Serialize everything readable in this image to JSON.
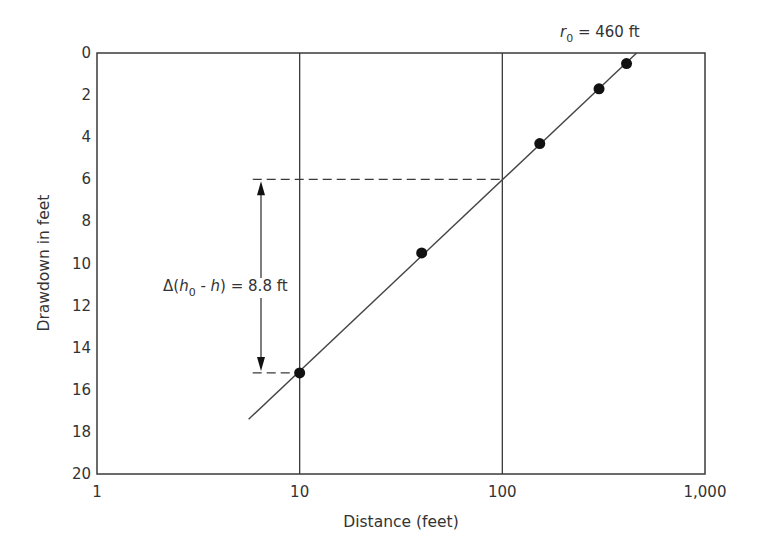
{
  "chart_data": {
    "type": "scatter",
    "title": "",
    "xlabel": "Distance (feet)",
    "ylabel": "Drawdown in feet",
    "xscale": "log",
    "xlim": [
      1,
      1000
    ],
    "ylim": [
      20,
      0
    ],
    "y_inverted": true,
    "grid": {
      "x_major": true,
      "y": false
    },
    "x_ticks": [
      1,
      10,
      100,
      1000
    ],
    "x_tick_labels": [
      "1",
      "10",
      "100",
      "1,000"
    ],
    "y_ticks": [
      0,
      2,
      4,
      6,
      8,
      10,
      12,
      14,
      16,
      18,
      20
    ],
    "y_tick_labels": [
      "0",
      "2",
      "4",
      "6",
      "8",
      "10",
      "12",
      "14",
      "16",
      "18",
      "20"
    ],
    "series": [
      {
        "name": "Observed drawdown",
        "marker": "filled-circle",
        "x": [
          10,
          40,
          153,
          300,
          410
        ],
        "y": [
          15.2,
          9.5,
          4.3,
          1.7,
          0.5
        ]
      },
      {
        "name": "Fitted line",
        "style": "solid-line",
        "x": [
          5.6,
          460
        ],
        "y": [
          17.4,
          0
        ]
      }
    ],
    "annotations": [
      {
        "text_parts": [
          "r",
          "0",
          " = 460 ft"
        ],
        "x": 460,
        "y": 0,
        "meaning": "radius of influence at zero drawdown"
      },
      {
        "text_parts": [
          "Δ(h",
          "0",
          " - h) = 8.8 ft"
        ],
        "meaning": "drawdown difference per log cycle",
        "from_y": 6.0,
        "to_y": 15.2,
        "arrow": "double"
      },
      {
        "type": "dashed-horizontal",
        "y": 6.0,
        "x_from": 6,
        "x_to": 100
      },
      {
        "type": "dashed-horizontal",
        "y": 15.2,
        "x_from": 6,
        "x_to": 10
      }
    ],
    "legend": null
  },
  "labels": {
    "xlabel": "Distance (feet)",
    "ylabel": "Drawdown in feet",
    "r0_var": "r",
    "r0_sub": "0",
    "r0_rest": " = 460 ft",
    "delta_prefix": "Δ(",
    "delta_h": "h",
    "delta_sub": "0",
    "delta_mid": " - ",
    "delta_h2": "h",
    "delta_rest": ") = 8.8 ft"
  }
}
